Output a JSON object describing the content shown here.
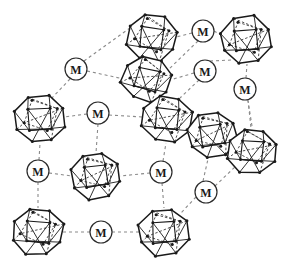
{
  "figure": {
    "background_color": "#ffffff",
    "canvas": {
      "width": 290,
      "height": 270
    }
  },
  "style": {
    "cluster_stroke_color": "#1a1a1a",
    "cluster_fill_color": "#ffffff",
    "cluster_vertex_color": "#1a1a1a",
    "cluster_inner_stroke_color": "#3a3a3a",
    "linker_stroke_color": "#2a2a2a",
    "linker_fill_color": "#ffffff",
    "linker_text_color": "#1a1a1a",
    "bond_color": "#8a8a8a",
    "bond_dash": "3,3",
    "bond_width": 1.1,
    "cluster_outer_width": 1.5,
    "cluster_inner_width": 0.9,
    "linker_circle_width": 1.2,
    "linker_radius": 11,
    "linker_font_size": 12,
    "cluster_radius": 26,
    "vertex_dot_radius": 1.5
  },
  "clusters": [
    {
      "id": "c1",
      "name": "cluster-node-1",
      "cx": 152,
      "cy": 38,
      "r": 26,
      "rot": 8
    },
    {
      "id": "c2",
      "name": "cluster-node-2",
      "cx": 246,
      "cy": 40,
      "r": 26,
      "rot": -6
    },
    {
      "id": "c3",
      "name": "cluster-node-3",
      "cx": 147,
      "cy": 79,
      "r": 25,
      "rot": 14
    },
    {
      "id": "c4",
      "name": "cluster-node-4",
      "cx": 40,
      "cy": 119,
      "r": 26,
      "rot": -4
    },
    {
      "id": "c5",
      "name": "cluster-node-5",
      "cx": 167,
      "cy": 119,
      "r": 26,
      "rot": 6
    },
    {
      "id": "c6",
      "name": "cluster-node-6",
      "cx": 212,
      "cy": 135,
      "r": 25,
      "rot": -10
    },
    {
      "id": "c7",
      "name": "cluster-node-7",
      "cx": 252,
      "cy": 151,
      "r": 25,
      "rot": 5
    },
    {
      "id": "c8",
      "name": "cluster-node-8",
      "cx": 96,
      "cy": 176,
      "r": 25,
      "rot": -8
    },
    {
      "id": "c9",
      "name": "cluster-node-9",
      "cx": 38,
      "cy": 232,
      "r": 26,
      "rot": 4
    },
    {
      "id": "c10",
      "name": "cluster-node-10",
      "cx": 164,
      "cy": 232,
      "r": 26,
      "rot": -5
    }
  ],
  "linkers": [
    {
      "id": "m1",
      "name": "metal-linker-1",
      "label": "M",
      "cx": 76,
      "cy": 69
    },
    {
      "id": "m2",
      "name": "metal-linker-2",
      "label": "M",
      "cx": 203,
      "cy": 31
    },
    {
      "id": "m3",
      "name": "metal-linker-3",
      "label": "M",
      "cx": 205,
      "cy": 71
    },
    {
      "id": "m4",
      "name": "metal-linker-4",
      "label": "M",
      "cx": 245,
      "cy": 89
    },
    {
      "id": "m5",
      "name": "metal-linker-5",
      "label": "M",
      "cx": 98,
      "cy": 113
    },
    {
      "id": "m6",
      "name": "metal-linker-6",
      "label": "M",
      "cx": 38,
      "cy": 171
    },
    {
      "id": "m7",
      "name": "metal-linker-7",
      "label": "M",
      "cx": 161,
      "cy": 172
    },
    {
      "id": "m8",
      "name": "metal-linker-8",
      "label": "M",
      "cx": 206,
      "cy": 192
    },
    {
      "id": "m9",
      "name": "metal-linker-9",
      "label": "M",
      "cx": 101,
      "cy": 232
    }
  ],
  "bonds": [
    {
      "name": "bond-m2-c1",
      "x1": 192,
      "y1": 33,
      "x2": 176,
      "y2": 37
    },
    {
      "name": "bond-m2-c2",
      "x1": 214,
      "y1": 31,
      "x2": 223,
      "y2": 36
    },
    {
      "name": "bond-m2-c3",
      "x1": 198,
      "y1": 41,
      "x2": 168,
      "y2": 70
    },
    {
      "name": "bond-m1-c1",
      "x1": 84,
      "y1": 61,
      "x2": 134,
      "y2": 25
    },
    {
      "name": "bond-m1-c3",
      "x1": 87,
      "y1": 71,
      "x2": 124,
      "y2": 79
    },
    {
      "name": "bond-m1-c4",
      "x1": 70,
      "y1": 79,
      "x2": 50,
      "y2": 100
    },
    {
      "name": "bond-m3-c3",
      "x1": 194,
      "y1": 73,
      "x2": 170,
      "y2": 80
    },
    {
      "name": "bond-m3-c2",
      "x1": 210,
      "y1": 61,
      "x2": 232,
      "y2": 60
    },
    {
      "name": "bond-m3-c5",
      "x1": 199,
      "y1": 80,
      "x2": 180,
      "y2": 98
    },
    {
      "name": "bond-m4-c2",
      "x1": 246,
      "y1": 78,
      "x2": 247,
      "y2": 64
    },
    {
      "name": "bond-m4-c7",
      "x1": 248,
      "y1": 100,
      "x2": 251,
      "y2": 128
    },
    {
      "name": "bond-m5-c4",
      "x1": 87,
      "y1": 114,
      "x2": 64,
      "y2": 117
    },
    {
      "name": "bond-m5-c5",
      "x1": 109,
      "y1": 115,
      "x2": 143,
      "y2": 117
    },
    {
      "name": "bond-m5-c8",
      "x1": 98,
      "y1": 124,
      "x2": 96,
      "y2": 153
    },
    {
      "name": "bond-m6-c4",
      "x1": 39,
      "y1": 160,
      "x2": 40,
      "y2": 143
    },
    {
      "name": "bond-m6-c8",
      "x1": 49,
      "y1": 173,
      "x2": 72,
      "y2": 176
    },
    {
      "name": "bond-m6-c9",
      "x1": 38,
      "y1": 182,
      "x2": 38,
      "y2": 208
    },
    {
      "name": "bond-m7-c8",
      "x1": 150,
      "y1": 173,
      "x2": 120,
      "y2": 176
    },
    {
      "name": "bond-m7-c5",
      "x1": 163,
      "y1": 161,
      "x2": 166,
      "y2": 143
    },
    {
      "name": "bond-m7-c10",
      "x1": 162,
      "y1": 183,
      "x2": 164,
      "y2": 208
    },
    {
      "name": "bond-m8-c6",
      "x1": 203,
      "y1": 181,
      "x2": 208,
      "y2": 159
    },
    {
      "name": "bond-m8-c7",
      "x1": 215,
      "y1": 186,
      "x2": 236,
      "y2": 166
    },
    {
      "name": "bond-m8-c10",
      "x1": 196,
      "y1": 197,
      "x2": 180,
      "y2": 214
    },
    {
      "name": "bond-m9-c9",
      "x1": 90,
      "y1": 232,
      "x2": 63,
      "y2": 232
    },
    {
      "name": "bond-m9-c10",
      "x1": 112,
      "y1": 232,
      "x2": 140,
      "y2": 232
    },
    {
      "name": "bond-c6-c5",
      "x1": 194,
      "y1": 124,
      "x2": 188,
      "y2": 122
    },
    {
      "name": "bond-c6-c7",
      "x1": 232,
      "y1": 142,
      "x2": 234,
      "y2": 143
    },
    {
      "name": "bond-c7-up",
      "x1": 252,
      "y1": 126,
      "x2": 248,
      "y2": 101
    }
  ]
}
